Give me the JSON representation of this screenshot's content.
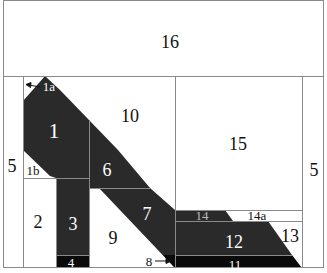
{
  "diagram": {
    "type": "pieced-panel-layout",
    "colors": {
      "background": "#ffffff",
      "border": "#8a8a8a",
      "dark_fill": "#2a2a2a",
      "black_fill": "#0a0a0a",
      "dark_text": "#ffffff",
      "light_text": "#111111",
      "seam": "#9a9a9a"
    },
    "pieces": [
      {
        "id": "16",
        "label": "16",
        "fill": "light"
      },
      {
        "id": "5-left",
        "label": "5",
        "fill": "light"
      },
      {
        "id": "5-right",
        "label": "5",
        "fill": "light"
      },
      {
        "id": "1",
        "label": "1",
        "fill": "dark"
      },
      {
        "id": "1a",
        "label": "1a",
        "fill": "light",
        "has_arrow": true
      },
      {
        "id": "1b",
        "label": "1b",
        "fill": "light"
      },
      {
        "id": "2",
        "label": "2",
        "fill": "light"
      },
      {
        "id": "3",
        "label": "3",
        "fill": "dark"
      },
      {
        "id": "4",
        "label": "4",
        "fill": "black"
      },
      {
        "id": "6",
        "label": "6",
        "fill": "dark"
      },
      {
        "id": "7",
        "label": "7",
        "fill": "dark"
      },
      {
        "id": "8",
        "label": "8",
        "fill": "light",
        "has_arrow": true
      },
      {
        "id": "9",
        "label": "9",
        "fill": "light"
      },
      {
        "id": "10",
        "label": "10",
        "fill": "light"
      },
      {
        "id": "11",
        "label": "11",
        "fill": "black"
      },
      {
        "id": "12",
        "label": "12",
        "fill": "dark"
      },
      {
        "id": "13",
        "label": "13",
        "fill": "light"
      },
      {
        "id": "14",
        "label": "14",
        "fill": "dark"
      },
      {
        "id": "14a",
        "label": "14a",
        "fill": "light"
      },
      {
        "id": "15",
        "label": "15",
        "fill": "light"
      }
    ]
  }
}
